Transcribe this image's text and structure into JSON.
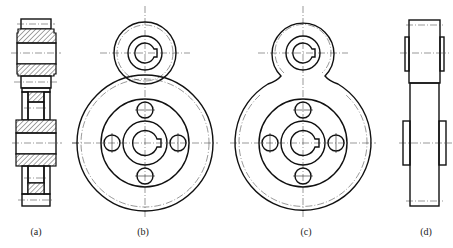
{
  "figure": {
    "views": [
      {
        "id": "a",
        "label": "(a)",
        "description": "sectional side view of gear pair with hatched sections"
      },
      {
        "id": "b",
        "label": "(b)",
        "description": "front view, two overlapping meshing gears with four lightening holes"
      },
      {
        "id": "c",
        "label": "(c)",
        "description": "front view, outline with blended fillets between gears"
      },
      {
        "id": "d",
        "label": "(d)",
        "description": "side outline view of gear pair"
      }
    ]
  }
}
